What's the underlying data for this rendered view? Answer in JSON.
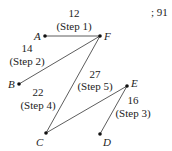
{
  "page_number": "; 91",
  "vertices": [
    {
      "id": "A",
      "label": "A",
      "x": 45,
      "y": 36,
      "lx": 34,
      "ly": 40
    },
    {
      "id": "F",
      "label": "F",
      "x": 100,
      "y": 36,
      "lx": 104,
      "ly": 40
    },
    {
      "id": "B",
      "label": "B",
      "x": 19,
      "y": 84,
      "lx": 8,
      "ly": 88
    },
    {
      "id": "E",
      "label": "E",
      "x": 127,
      "y": 86,
      "lx": 131,
      "ly": 87
    },
    {
      "id": "C",
      "label": "C",
      "x": 46,
      "y": 133,
      "lx": 36,
      "ly": 146
    },
    {
      "id": "D",
      "label": "D",
      "x": 100,
      "y": 134,
      "lx": 103,
      "ly": 146
    }
  ],
  "edges": [
    {
      "from": "A",
      "to": "F",
      "weight": "12",
      "step": "(Step 1)",
      "wx": 75,
      "wy": 17,
      "sx": 75,
      "sy": 30
    },
    {
      "from": "F",
      "to": "B",
      "weight": "14",
      "step": "(Step 2)",
      "wx": 28,
      "wy": 52,
      "sx": 28,
      "sy": 65
    },
    {
      "from": "E",
      "to": "D",
      "weight": "16",
      "step": "(Step 3)",
      "wx": 133,
      "wy": 104,
      "sx": 133,
      "sy": 117
    },
    {
      "from": "C",
      "to": "F",
      "weight": "22",
      "step": "(Step 4)",
      "wx": 38,
      "wy": 96,
      "sx": 38,
      "sy": 109
    },
    {
      "from": "C",
      "to": "E",
      "weight": "27",
      "step": "(Step 5)",
      "wx": 95,
      "wy": 78,
      "sx": 95,
      "sy": 90
    }
  ]
}
